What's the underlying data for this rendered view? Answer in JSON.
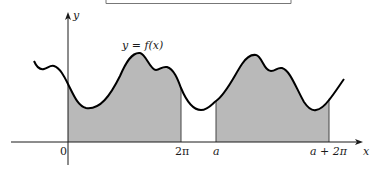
{
  "figure": {
    "function_label": "y = f(x)",
    "axes": {
      "x_label": "x",
      "y_label": "y"
    },
    "x_ticks": [
      {
        "label": "0",
        "italic": false
      },
      {
        "label": "2π",
        "italic": false
      },
      {
        "label": "a",
        "italic": true
      },
      {
        "label": "a + 2π",
        "italic": true
      }
    ],
    "shaded_regions": [
      {
        "from": "0",
        "to": "2π"
      },
      {
        "from": "a",
        "to": "a + 2π"
      }
    ],
    "colors": {
      "curve": "#000000",
      "fill": "#b9b9b9",
      "axis": "#1a1a1a",
      "bound_line": "#555555"
    }
  }
}
